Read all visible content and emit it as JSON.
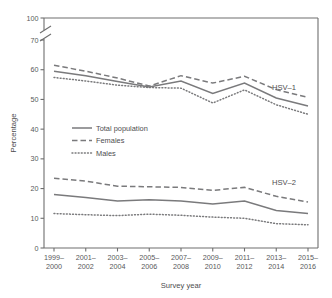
{
  "chart_data": {
    "type": "line",
    "title": "",
    "xlabel": "Survey year",
    "ylabel": "Percentage",
    "categories": [
      "1999–\n2000",
      "2001–\n2002",
      "2003–\n2004",
      "2005–\n2006",
      "2007–\n2008",
      "2009–\n2010",
      "2011–\n2012",
      "2013–\n2014",
      "2015–\n2016"
    ],
    "x_tick_labels": [
      {
        "top": "1999–",
        "bottom": "2000"
      },
      {
        "top": "2001–",
        "bottom": "2002"
      },
      {
        "top": "2003–",
        "bottom": "2004"
      },
      {
        "top": "2005–",
        "bottom": "2006"
      },
      {
        "top": "2007–",
        "bottom": "2008"
      },
      {
        "top": "2009–",
        "bottom": "2010"
      },
      {
        "top": "2011–",
        "bottom": "2012"
      },
      {
        "top": "2013–",
        "bottom": "2014"
      },
      {
        "top": "2015–",
        "bottom": "2016"
      }
    ],
    "y_tick_labels": [
      "0",
      "10",
      "20",
      "30",
      "40",
      "50",
      "60",
      "70",
      "100"
    ],
    "ylim": [
      0,
      100
    ],
    "axis_break": {
      "between": [
        70,
        100
      ],
      "present": true
    },
    "grid": false,
    "legend_position": "center-left",
    "legend_entries": [
      {
        "label": "Total population",
        "style": "solid"
      },
      {
        "label": "Females",
        "style": "dashed"
      },
      {
        "label": "Males",
        "style": "dotted"
      }
    ],
    "group_labels": [
      {
        "label": "HSV–1",
        "value": 54
      },
      {
        "label": "HSV–2",
        "value": 22
      }
    ],
    "groups": [
      {
        "name": "HSV–1",
        "series": [
          {
            "name": "Total population",
            "style": "solid",
            "values": [
              59.5,
              58.0,
              56.0,
              54.2,
              56.2,
              52.0,
              55.5,
              50.5,
              47.8
            ]
          },
          {
            "name": "Females",
            "style": "dashed",
            "values": [
              61.5,
              59.5,
              57.2,
              54.5,
              58.0,
              55.5,
              57.8,
              53.3,
              50.7
            ]
          },
          {
            "name": "Males",
            "style": "dotted",
            "values": [
              57.4,
              56.2,
              54.8,
              54.0,
              53.8,
              48.8,
              53.2,
              48.2,
              45.0
            ]
          }
        ]
      },
      {
        "name": "HSV–2",
        "series": [
          {
            "name": "Total population",
            "style": "solid",
            "values": [
              18.0,
              17.0,
              15.8,
              16.2,
              15.8,
              14.8,
              15.8,
              12.6,
              11.6
            ]
          },
          {
            "name": "Females",
            "style": "dashed",
            "values": [
              23.5,
              22.5,
              20.8,
              20.6,
              20.4,
              19.4,
              20.4,
              17.4,
              15.5
            ]
          },
          {
            "name": "Males",
            "style": "dotted",
            "values": [
              11.6,
              11.2,
              10.9,
              11.4,
              11.0,
              10.4,
              10.0,
              8.2,
              7.8
            ]
          }
        ]
      }
    ],
    "colors": {
      "line": "#7a7a7c",
      "axis": "#6e6e6e",
      "text": "#4d4d4f",
      "background": "#ffffff"
    }
  }
}
